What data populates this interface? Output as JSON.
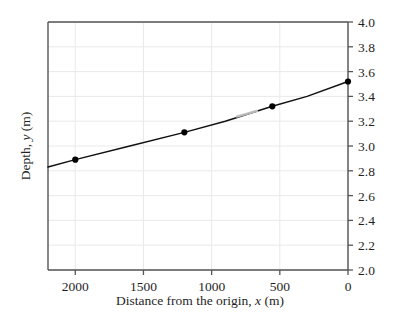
{
  "figure": {
    "background": "#ffffff",
    "axis_color": "#555555",
    "grid_color": "#e9e9e9",
    "line_color": "#111111",
    "marker_color": "#000000",
    "artifact_color": "#b9b9b9"
  },
  "chart_data": {
    "type": "line",
    "title": "",
    "xlabel_prefix": "Distance from the origin, ",
    "xlabel_symbol": "x",
    "xlabel_suffix": " (m)",
    "ylabel_prefix": "Depth, ",
    "ylabel_symbol": "y",
    "ylabel_suffix": " (m)",
    "x_ticks": [
      2000,
      1500,
      1000,
      500,
      0
    ],
    "x_tick_labels": [
      "2000",
      "1500",
      "1000",
      "500",
      "0"
    ],
    "y_ticks": [
      2.0,
      2.2,
      2.4,
      2.6,
      2.8,
      3.0,
      3.2,
      3.4,
      3.6,
      3.8,
      4.0
    ],
    "y_tick_labels": [
      "2.0",
      "2.2",
      "2.4",
      "2.6",
      "2.8",
      "3.0",
      "3.2",
      "3.4",
      "3.6",
      "3.8",
      "4.0"
    ],
    "xlim": [
      2200,
      0
    ],
    "ylim": [
      2.0,
      4.0
    ],
    "x_axis_reversed": true,
    "y_axis_position": "right",
    "grid": true,
    "legend": "none",
    "series": [
      {
        "name": "Depth profile",
        "x": [
          2200,
          2000,
          1600,
          1200,
          900,
          555,
          300,
          0
        ],
        "y": [
          2.83,
          2.89,
          3.0,
          3.11,
          3.2,
          3.32,
          3.4,
          3.52
        ]
      }
    ],
    "markers": {
      "x": [
        2000,
        1200,
        555,
        0
      ],
      "y": [
        2.89,
        3.11,
        3.32,
        3.52
      ]
    },
    "artifact_segment": {
      "x": [
        820,
        660
      ],
      "y": [
        3.235,
        3.285
      ]
    }
  }
}
